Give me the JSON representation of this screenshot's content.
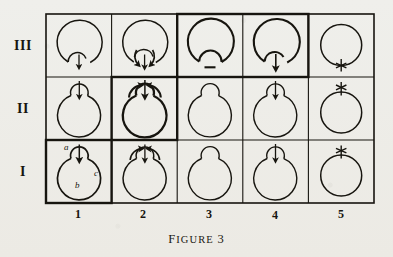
{
  "figure": {
    "caption_prefix": "F",
    "caption_rest": "IGURE",
    "caption_number": "3",
    "caption_full": "FIGURE 3"
  },
  "grid": {
    "row_labels": [
      "III",
      "II",
      "I"
    ],
    "column_labels": [
      "1",
      "2",
      "3",
      "4",
      "5"
    ],
    "rows": 3,
    "columns": 5,
    "ink_color": "#17150f",
    "paper_color": "#efefeb"
  },
  "annotations": {
    "cell_I1": {
      "label_a": "a",
      "label_b": "b",
      "label_c": "c"
    }
  },
  "cells": [
    {
      "id": "III-1",
      "row": "III",
      "col": "1",
      "emphasis": "normal",
      "bulge": "bottom",
      "marker": "arrow-down",
      "arrows": "single-down",
      "description": "large circle with small bottom lobe and a single downward arrow"
    },
    {
      "id": "III-2",
      "row": "III",
      "col": "2",
      "emphasis": "normal",
      "bulge": "bottom",
      "marker": "arrow-down",
      "arrows": "converging-pair-down",
      "description": "large circle with small bottom lobe, downward arrow flanked by two curved arrowheads"
    },
    {
      "id": "III-3",
      "row": "III",
      "col": "3",
      "emphasis": "thick",
      "bulge": "bottom",
      "marker": "none",
      "arrows": "none",
      "description": "large circle with small bottom lobe, heavy outline, no arrow"
    },
    {
      "id": "III-4",
      "row": "III",
      "col": "4",
      "emphasis": "thick",
      "bulge": "bottom",
      "marker": "arrow-down",
      "arrows": "single-down",
      "description": "large circle with small bottom lobe, heavy outline, single downward arrow"
    },
    {
      "id": "III-5",
      "row": "III",
      "col": "5",
      "emphasis": "normal",
      "bulge": "none",
      "marker": "asterisk-bottom",
      "arrows": "none",
      "description": "plain circle with an asterisk at the bottom"
    },
    {
      "id": "II-1",
      "row": "II",
      "col": "1",
      "emphasis": "normal",
      "bulge": "top",
      "marker": "arrow-down",
      "arrows": "single-down",
      "description": "circle with small top lobe and a downward arrow entering it"
    },
    {
      "id": "II-2",
      "row": "II",
      "col": "2",
      "emphasis": "thick",
      "bulge": "top",
      "marker": "arrow-down",
      "arrows": "converging-pair-up",
      "description": "heavy circle with small top lobe, downward arrow flanked by two curved arrowheads"
    },
    {
      "id": "II-3",
      "row": "II",
      "col": "3",
      "emphasis": "normal",
      "bulge": "top",
      "marker": "none",
      "arrows": "none",
      "description": "circle with small top lobe, no arrow"
    },
    {
      "id": "II-4",
      "row": "II",
      "col": "4",
      "emphasis": "normal",
      "bulge": "top",
      "marker": "arrow-down",
      "arrows": "single-down",
      "description": "circle with small top lobe and a downward arrow"
    },
    {
      "id": "II-5",
      "row": "II",
      "col": "5",
      "emphasis": "normal",
      "bulge": "none",
      "marker": "asterisk-top",
      "arrows": "none",
      "description": "plain circle with an asterisk at the top"
    },
    {
      "id": "I-1",
      "row": "I",
      "col": "1",
      "emphasis": "thick",
      "bulge": "top",
      "marker": "arrow-down",
      "arrows": "single-down",
      "labels": [
        "a",
        "b",
        "c"
      ],
      "description": "circle with small top lobe, downward arrow, labelled a (upper left), b (bottom), c (right)"
    },
    {
      "id": "I-2",
      "row": "I",
      "col": "2",
      "emphasis": "normal",
      "bulge": "top",
      "marker": "arrow-down",
      "arrows": "converging-pair-up",
      "description": "circle with small top lobe, downward arrow flanked by two curved arrowheads"
    },
    {
      "id": "I-3",
      "row": "I",
      "col": "3",
      "emphasis": "normal",
      "bulge": "top",
      "marker": "none",
      "arrows": "none",
      "description": "circle with small top lobe, no arrow"
    },
    {
      "id": "I-4",
      "row": "I",
      "col": "4",
      "emphasis": "normal",
      "bulge": "top",
      "marker": "arrow-down",
      "arrows": "single-down",
      "description": "circle with small top lobe and a downward arrow"
    },
    {
      "id": "I-5",
      "row": "I",
      "col": "5",
      "emphasis": "normal",
      "bulge": "none",
      "marker": "asterisk-top",
      "arrows": "none",
      "description": "plain circle with an asterisk at the top"
    }
  ]
}
